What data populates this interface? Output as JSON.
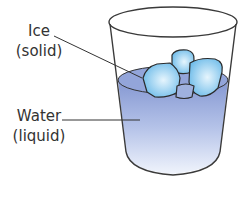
{
  "diagram": {
    "labels": {
      "ice": {
        "name": "Ice",
        "state": "(solid)"
      },
      "water": {
        "name": "Water",
        "state": "(liquid)"
      }
    },
    "colors": {
      "water_top": "#8a9fd6",
      "water_bottom": "#eef2fb",
      "ice_fill": "#7fc6ef",
      "ice_highlight": "#dff1fc",
      "outline": "#333333",
      "text": "#333333"
    }
  }
}
